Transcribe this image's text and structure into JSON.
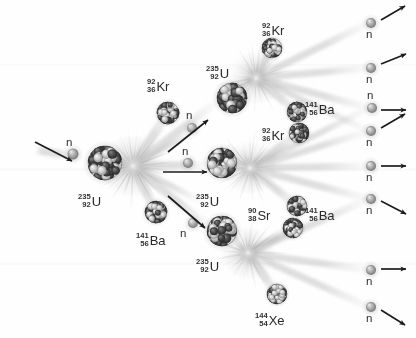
{
  "diagram": {
    "background_color": "#fefefe",
    "width": 416,
    "height": 338
  },
  "palette": {
    "nucleus_dark": "#3a3a3a",
    "nucleus_light": "#c9c9c9",
    "neutron": "#9a9a9a",
    "streak": "#b9b9b9",
    "burst": "#d0d0d0",
    "arrow": "#1c1c1c",
    "text": "#2b2b2b"
  },
  "neutron_symbol": "n",
  "nuclei": [
    {
      "id": "u235-gen1",
      "label": {
        "mass": "235",
        "atomic": "92",
        "symbol": "U"
      },
      "label_x": 78,
      "label_y": 193,
      "cx": 105,
      "cy": 163,
      "r": 17,
      "kind": "target"
    },
    {
      "id": "kr92-gen1",
      "label": {
        "mass": "92",
        "atomic": "36",
        "symbol": "Kr"
      },
      "label_x": 147,
      "label_y": 78,
      "cx": 168,
      "cy": 113,
      "r": 11,
      "kind": "fragment"
    },
    {
      "id": "ba141-gen1",
      "label": {
        "mass": "141",
        "atomic": "56",
        "symbol": "Ba"
      },
      "label_x": 136,
      "label_y": 232,
      "cx": 156,
      "cy": 212,
      "r": 11,
      "kind": "fragment"
    },
    {
      "id": "u235-gen2-top",
      "label": {
        "mass": "235",
        "atomic": "92",
        "symbol": "U"
      },
      "label_x": 206,
      "label_y": 65,
      "cx": 232,
      "cy": 98,
      "r": 15,
      "kind": "target"
    },
    {
      "id": "u235-gen2-mid",
      "label": {
        "mass": "235",
        "atomic": "92",
        "symbol": "U"
      },
      "label_x": 196,
      "label_y": 193,
      "cx": 222,
      "cy": 163,
      "r": 15,
      "kind": "target"
    },
    {
      "id": "u235-gen2-bot",
      "label": {
        "mass": "235",
        "atomic": "92",
        "symbol": "U"
      },
      "label_x": 196,
      "label_y": 258,
      "cx": 222,
      "cy": 231,
      "r": 15,
      "kind": "target"
    },
    {
      "id": "kr92-gen2-top",
      "label": {
        "mass": "92",
        "atomic": "36",
        "symbol": "Kr"
      },
      "label_x": 262,
      "label_y": 22,
      "cx": 272,
      "cy": 48,
      "r": 10,
      "kind": "fragment"
    },
    {
      "id": "ba141-gen2-top",
      "label": {
        "mass": "141",
        "atomic": "56",
        "symbol": "Ba"
      },
      "label_x": 305,
      "label_y": 101,
      "cx": 297,
      "cy": 112,
      "r": 10,
      "kind": "fragment"
    },
    {
      "id": "kr92-gen2-mid",
      "label": {
        "mass": "92",
        "atomic": "36",
        "symbol": "Kr"
      },
      "label_x": 262,
      "label_y": 127,
      "cx": 299,
      "cy": 133,
      "r": 10,
      "kind": "fragment"
    },
    {
      "id": "ba141-gen2-mid",
      "label": {
        "mass": "141",
        "atomic": "56",
        "symbol": "Ba"
      },
      "label_x": 305,
      "label_y": 207,
      "cx": 297,
      "cy": 206,
      "r": 10,
      "kind": "fragment"
    },
    {
      "id": "sr90-gen2-bot",
      "label": {
        "mass": "90",
        "atomic": "38",
        "symbol": "Sr"
      },
      "label_x": 248,
      "label_y": 207,
      "cx": 293,
      "cy": 228,
      "r": 10,
      "kind": "fragment"
    },
    {
      "id": "xe144-gen2-bot",
      "label": {
        "mass": "144",
        "atomic": "54",
        "symbol": "Xe"
      },
      "label_x": 255,
      "label_y": 312,
      "cx": 277,
      "cy": 294,
      "r": 10,
      "kind": "fragment"
    }
  ],
  "neutrons": [
    {
      "id": "n-incident",
      "cx": 73,
      "cy": 154,
      "r": 5.5,
      "label_x": 66,
      "label_y": 137
    },
    {
      "id": "n-gen1-top",
      "cx": 192,
      "cy": 128,
      "r": 5,
      "label_x": 186,
      "label_y": 110
    },
    {
      "id": "n-gen1-mid",
      "cx": 188,
      "cy": 163,
      "r": 5,
      "label_x": 182,
      "label_y": 146
    },
    {
      "id": "n-gen1-bot",
      "cx": 193,
      "cy": 223,
      "r": 5,
      "label_x": 180,
      "label_y": 228
    },
    {
      "id": "n-out-1",
      "cx": 371,
      "cy": 23,
      "r": 5,
      "label_x": 366,
      "label_y": 29
    },
    {
      "id": "n-out-2",
      "cx": 371,
      "cy": 68,
      "r": 5,
      "label_x": 366,
      "label_y": 74
    },
    {
      "id": "n-out-3",
      "cx": 372,
      "cy": 108,
      "r": 5,
      "label_x": 367,
      "label_y": 90
    },
    {
      "id": "n-out-4",
      "cx": 371,
      "cy": 131,
      "r": 5,
      "label_x": 366,
      "label_y": 137
    },
    {
      "id": "n-out-5",
      "cx": 371,
      "cy": 166,
      "r": 5,
      "label_x": 366,
      "label_y": 172
    },
    {
      "id": "n-out-6",
      "cx": 371,
      "cy": 199,
      "r": 5,
      "label_x": 366,
      "label_y": 205
    },
    {
      "id": "n-out-7",
      "cx": 371,
      "cy": 270,
      "r": 5,
      "label_x": 366,
      "label_y": 276
    },
    {
      "id": "n-out-8",
      "cx": 371,
      "cy": 307,
      "r": 5,
      "label_x": 366,
      "label_y": 313
    }
  ],
  "arrows": [
    {
      "id": "arrow-incident",
      "x1": 35,
      "y1": 142,
      "x2": 72,
      "y2": 161
    },
    {
      "id": "arrow-gen1-top",
      "x1": 168,
      "y1": 152,
      "x2": 208,
      "y2": 120
    },
    {
      "id": "arrow-gen1-mid",
      "x1": 163,
      "y1": 172,
      "x2": 207,
      "y2": 172
    },
    {
      "id": "arrow-gen1-bot",
      "x1": 168,
      "y1": 196,
      "x2": 205,
      "y2": 228
    },
    {
      "id": "arrow-out-1",
      "x1": 381,
      "y1": 20,
      "x2": 405,
      "y2": 6
    },
    {
      "id": "arrow-out-2",
      "x1": 381,
      "y1": 64,
      "x2": 406,
      "y2": 54
    },
    {
      "id": "arrow-out-3",
      "x1": 381,
      "y1": 110,
      "x2": 406,
      "y2": 110
    },
    {
      "id": "arrow-out-4",
      "x1": 381,
      "y1": 128,
      "x2": 405,
      "y2": 114
    },
    {
      "id": "arrow-out-5",
      "x1": 381,
      "y1": 166,
      "x2": 406,
      "y2": 166
    },
    {
      "id": "arrow-out-6",
      "x1": 381,
      "y1": 201,
      "x2": 406,
      "y2": 214
    },
    {
      "id": "arrow-out-7",
      "x1": 381,
      "y1": 269,
      "x2": 406,
      "y2": 269
    },
    {
      "id": "arrow-out-8",
      "x1": 381,
      "y1": 310,
      "x2": 405,
      "y2": 325
    }
  ],
  "bursts": [
    {
      "id": "burst-gen1",
      "cx": 133,
      "cy": 166,
      "rx": 34,
      "ry": 30
    },
    {
      "id": "burst-gen2-top",
      "cx": 256,
      "cy": 78,
      "rx": 28,
      "ry": 26
    },
    {
      "id": "burst-gen2-mid",
      "cx": 250,
      "cy": 168,
      "rx": 28,
      "ry": 26
    },
    {
      "id": "burst-gen2-bot",
      "cx": 248,
      "cy": 253,
      "rx": 28,
      "ry": 26
    }
  ],
  "streaks": [
    {
      "from": [
        133,
        166
      ],
      "to": [
        168,
        113
      ],
      "w": 9
    },
    {
      "from": [
        133,
        166
      ],
      "to": [
        156,
        212
      ],
      "w": 9
    },
    {
      "from": [
        133,
        166
      ],
      "to": [
        214,
        104
      ],
      "w": 8
    },
    {
      "from": [
        133,
        166
      ],
      "to": [
        205,
        165
      ],
      "w": 8
    },
    {
      "from": [
        133,
        166
      ],
      "to": [
        208,
        226
      ],
      "w": 8
    },
    {
      "from": [
        133,
        166
      ],
      "to": [
        196,
        130
      ],
      "w": 6
    },
    {
      "from": [
        133,
        166
      ],
      "to": [
        198,
        200
      ],
      "w": 6
    },
    {
      "from": [
        256,
        78
      ],
      "to": [
        272,
        48
      ],
      "w": 8
    },
    {
      "from": [
        256,
        78
      ],
      "to": [
        297,
        112
      ],
      "w": 8
    },
    {
      "from": [
        256,
        78
      ],
      "to": [
        369,
        23
      ],
      "w": 7
    },
    {
      "from": [
        256,
        78
      ],
      "to": [
        369,
        68
      ],
      "w": 7
    },
    {
      "from": [
        256,
        78
      ],
      "to": [
        369,
        108
      ],
      "w": 7
    },
    {
      "from": [
        256,
        78
      ],
      "to": [
        369,
        131
      ],
      "w": 6
    },
    {
      "from": [
        250,
        168
      ],
      "to": [
        299,
        133
      ],
      "w": 8
    },
    {
      "from": [
        250,
        168
      ],
      "to": [
        297,
        206
      ],
      "w": 8
    },
    {
      "from": [
        250,
        168
      ],
      "to": [
        369,
        131
      ],
      "w": 7
    },
    {
      "from": [
        250,
        168
      ],
      "to": [
        369,
        166
      ],
      "w": 7
    },
    {
      "from": [
        250,
        168
      ],
      "to": [
        369,
        199
      ],
      "w": 7
    },
    {
      "from": [
        250,
        168
      ],
      "to": [
        369,
        108
      ],
      "w": 6
    },
    {
      "from": [
        248,
        253
      ],
      "to": [
        293,
        228
      ],
      "w": 8
    },
    {
      "from": [
        248,
        253
      ],
      "to": [
        277,
        294
      ],
      "w": 8
    },
    {
      "from": [
        248,
        253
      ],
      "to": [
        369,
        199
      ],
      "w": 7
    },
    {
      "from": [
        248,
        253
      ],
      "to": [
        369,
        270
      ],
      "w": 7
    },
    {
      "from": [
        248,
        253
      ],
      "to": [
        369,
        307
      ],
      "w": 7
    },
    {
      "from": [
        35,
        150
      ],
      "to": [
        73,
        156
      ],
      "w": 8
    }
  ]
}
